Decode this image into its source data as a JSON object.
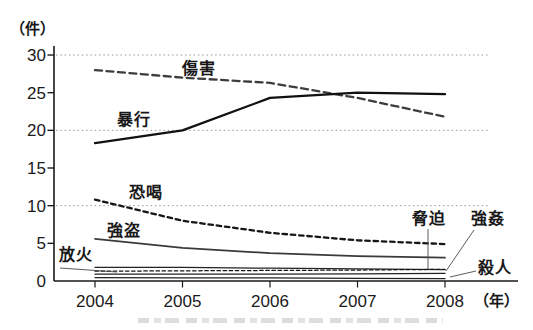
{
  "unit_labels": {
    "y_unit": "（件）",
    "x_unit": "（年）"
  },
  "chart_data": {
    "type": "line",
    "x": [
      2004,
      2005,
      2006,
      2007,
      2008
    ],
    "xlabel": "（年）",
    "ylabel": "（件）",
    "ylim": [
      0,
      30
    ],
    "yticks": [
      0,
      5,
      10,
      15,
      20,
      25,
      30
    ],
    "gridlines_at": [
      10,
      20,
      30
    ],
    "grid": "dotted horizontal lines",
    "legend_position": "inline labels with leader lines",
    "series": [
      {
        "name": "傷害",
        "values": [
          28.0,
          27.0,
          26.3,
          24.3,
          21.8
        ],
        "line_style": "dashed",
        "dash": "7 4.5",
        "weight": "bold",
        "color": "#3d3d3d"
      },
      {
        "name": "暴行",
        "values": [
          18.3,
          20.0,
          24.3,
          25.0,
          24.8
        ],
        "line_style": "solid",
        "dash": "",
        "weight": "bold",
        "color": "#111111"
      },
      {
        "name": "恐喝",
        "values": [
          10.8,
          8.0,
          6.4,
          5.4,
          4.9
        ],
        "line_style": "dashed",
        "dash": "4.5 3.8",
        "weight": "bold",
        "color": "#161616"
      },
      {
        "name": "強盗",
        "values": [
          5.6,
          4.4,
          3.7,
          3.3,
          3.1
        ],
        "line_style": "solid",
        "dash": "",
        "weight": "medium",
        "color": "#3a3a3a"
      },
      {
        "name": "放火",
        "values": [
          1.8,
          1.8,
          1.7,
          1.6,
          1.5
        ],
        "line_style": "solid",
        "dash": "",
        "weight": "thin",
        "color": "#222222"
      },
      {
        "name": "脅迫",
        "values": [
          1.3,
          1.35,
          1.4,
          1.45,
          1.55
        ],
        "line_style": "fine-dashed",
        "dash": "3.5 2.6",
        "weight": "thin",
        "color": "#161616"
      },
      {
        "name": "強姦",
        "values": [
          0.9,
          0.9,
          0.9,
          0.95,
          1.0
        ],
        "line_style": "solid",
        "dash": "",
        "weight": "thin",
        "color": "#222222"
      },
      {
        "name": "殺人",
        "values": [
          0.45,
          0.4,
          0.4,
          0.35,
          0.3
        ],
        "line_style": "solid",
        "dash": "",
        "weight": "thin",
        "color": "#222222"
      }
    ]
  }
}
